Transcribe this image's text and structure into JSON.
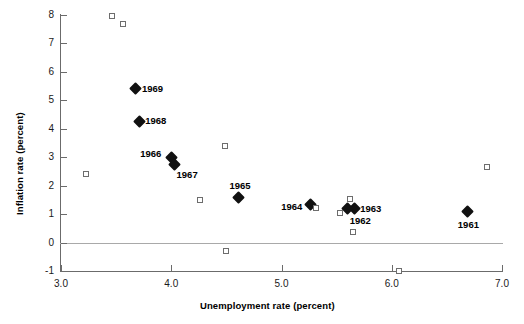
{
  "chart_data": {
    "type": "scatter",
    "title": "",
    "xlabel": "Unemployment rate (percent)",
    "ylabel": "Inflation rate (percent)",
    "xlim": [
      3.0,
      7.0
    ],
    "ylim": [
      -1,
      8
    ],
    "xticks": [
      "3.0",
      "4.0",
      "5.0",
      "6.0",
      "7.0"
    ],
    "xtick_values": [
      3.0,
      4.0,
      5.0,
      6.0,
      7.0
    ],
    "yticks": [
      "8",
      "7",
      "6",
      "5",
      "4",
      "3",
      "2",
      "1",
      "0",
      "-1"
    ],
    "ytick_values": [
      8,
      7,
      6,
      5,
      4,
      3,
      2,
      1,
      0,
      -1
    ],
    "grid": false,
    "legend": "none",
    "zero_line": true,
    "series": [
      {
        "name": "labeled-years",
        "marker": "filled-diamond",
        "color": "#111111",
        "points": [
          {
            "label": "1969",
            "x": 3.68,
            "y": 5.41,
            "label_pos": "right"
          },
          {
            "label": "1968",
            "x": 3.71,
            "y": 4.26,
            "label_pos": "right"
          },
          {
            "label": "1966",
            "x": 4.0,
            "y": 2.99,
            "label_pos": "upper-left"
          },
          {
            "label": "1967",
            "x": 4.03,
            "y": 2.75,
            "label_pos": "lower-right"
          },
          {
            "label": "1965",
            "x": 4.61,
            "y": 1.57,
            "label_pos": "above"
          },
          {
            "label": "1964",
            "x": 5.26,
            "y": 1.33,
            "label_pos": "left"
          },
          {
            "label": "1963",
            "x": 5.66,
            "y": 1.19,
            "label_pos": "right"
          },
          {
            "label": "1962",
            "x": 5.6,
            "y": 1.19,
            "label_pos": "below-right"
          },
          {
            "label": "1961",
            "x": 6.69,
            "y": 1.09,
            "label_pos": "below"
          }
        ]
      },
      {
        "name": "other-observations",
        "marker": "open-square",
        "color": "#6d6d6d",
        "points": [
          {
            "label": "",
            "x": 3.46,
            "y": 7.95
          },
          {
            "label": "",
            "x": 3.56,
            "y": 7.67
          },
          {
            "label": "",
            "x": 4.49,
            "y": 3.38
          },
          {
            "label": "",
            "x": 3.23,
            "y": 2.4
          },
          {
            "label": "",
            "x": 6.86,
            "y": 2.64
          },
          {
            "label": "",
            "x": 4.26,
            "y": 1.48
          },
          {
            "label": "",
            "x": 5.31,
            "y": 1.21
          },
          {
            "label": "",
            "x": 5.62,
            "y": 1.52
          },
          {
            "label": "",
            "x": 5.53,
            "y": 1.04
          },
          {
            "label": "",
            "x": 5.65,
            "y": 0.36
          },
          {
            "label": "",
            "x": 4.5,
            "y": -0.31
          },
          {
            "label": "",
            "x": 6.07,
            "y": -1.0
          }
        ]
      }
    ]
  },
  "axes": {
    "x_label": "Unemployment rate (percent)",
    "y_label": "Inflation rate (percent)"
  }
}
